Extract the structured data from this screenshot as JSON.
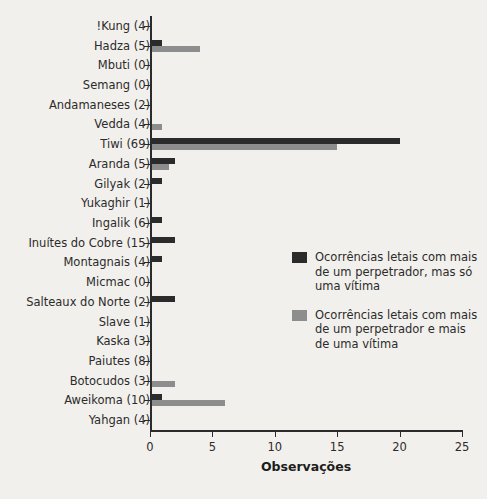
{
  "chart_data": {
    "type": "bar",
    "orientation": "horizontal",
    "title": "",
    "xlabel": "Observações",
    "ylabel": "",
    "xlim": [
      0,
      25
    ],
    "xticks": [
      0,
      5,
      10,
      15,
      20,
      25
    ],
    "xtick_labels": [
      "0",
      "5",
      "10",
      "15",
      "20",
      "25"
    ],
    "grid": false,
    "legend_position": "center-right",
    "categories": [
      "!Kung (4)",
      "Hadza (5)",
      "Mbuti (0)",
      "Semang (0)",
      "Andamaneses (2)",
      "Vedda (4)",
      "Tiwi (69)",
      "Aranda (5)",
      "Gilyak (2)",
      "Yukaghir (1)",
      "Ingalik (6)",
      "Inuítes do Cobre (15)",
      "Montagnais (4)",
      "Micmac (0)",
      "Salteaux do Norte (2)",
      "Slave (1)",
      "Kaska (3)",
      "Paiutes (8)",
      "Botocudos (3)",
      "Aweikoma (10)",
      "Yahgan (4)"
    ],
    "series": [
      {
        "name": "Ocorrências letais com mais de um perpetrador, mas só uma vítima",
        "color": "#2b2b2b",
        "values": [
          0,
          1,
          0,
          0,
          0,
          0,
          20,
          2,
          1,
          0,
          1,
          2,
          1,
          0,
          2,
          0,
          0,
          0,
          0,
          1,
          0
        ]
      },
      {
        "name": "Ocorrências letais com mais de um perpetrador e mais de uma vítima",
        "color": "#8d8d8d",
        "values": [
          0,
          4,
          0,
          0,
          0,
          1,
          15,
          1.5,
          0,
          0,
          0,
          0,
          0,
          0,
          0,
          0,
          0,
          0,
          2,
          6,
          0
        ]
      }
    ]
  },
  "legend": {
    "items": [
      {
        "label": "Ocorrências letais com mais de um perpetrador, mas só uma vítima",
        "color": "#2b2b2b"
      },
      {
        "label": "Ocorrências letais com mais de um perpetrador e mais de uma vítima",
        "color": "#8d8d8d"
      }
    ]
  },
  "colors": {
    "background": "#f2f0ec",
    "axis": "#2b2b2b",
    "series_dark": "#2b2b2b",
    "series_light": "#8d8d8d",
    "text": "#2b2b2b"
  }
}
